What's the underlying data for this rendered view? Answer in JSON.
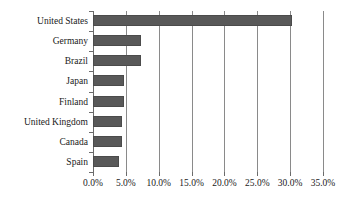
{
  "chart_data": {
    "type": "bar",
    "orientation": "horizontal",
    "title": "",
    "subtitle": "",
    "xlabel": "",
    "ylabel": "",
    "categories": [
      "United States",
      "Germany",
      "Brazil",
      "Japan",
      "Finland",
      "United Kingdom",
      "Canada",
      "Spain"
    ],
    "values": [
      30.3,
      7.3,
      7.3,
      4.7,
      4.7,
      4.4,
      4.4,
      3.9
    ],
    "value_unit": "%",
    "series": [
      {
        "name": "Share",
        "values": [
          30.3,
          7.3,
          7.3,
          4.7,
          4.7,
          4.4,
          4.4,
          3.9
        ]
      }
    ],
    "xlim": [
      0,
      35
    ],
    "xticks": [
      0,
      5,
      10,
      15,
      20,
      25,
      30,
      35
    ],
    "xtick_labels": [
      "0.0%",
      "5.0%",
      "10.0%",
      "15.0%",
      "20.0%",
      "25.0%",
      "30.0%",
      "35.0%"
    ],
    "grid": true,
    "grid_axis": "x",
    "legend": false,
    "legend_position": "none",
    "bar_color": "#595959",
    "bar_edge_color": "#4b4b4b",
    "grid_color": "#8a8a8a",
    "axis_color": "#6b6b6b",
    "text_color": "#1a1a1a",
    "background_color": "#ffffff"
  }
}
